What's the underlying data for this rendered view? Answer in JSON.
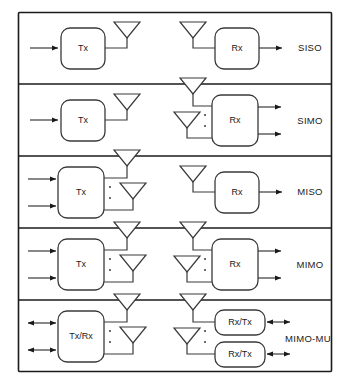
{
  "figure": {
    "title": "",
    "rows": [
      {
        "id": "siso",
        "mode_label": "SISO",
        "tx_label": "Tx",
        "rx_label": "Rx",
        "tx_inputs": 1,
        "rx_outputs": 1,
        "tx_antennas": 1,
        "rx_antennas": 1,
        "tx_ellipsis": false,
        "rx_ellipsis": false,
        "bidirectional": false
      },
      {
        "id": "simo",
        "mode_label": "SIMO",
        "tx_label": "Tx",
        "rx_label": "Rx",
        "tx_inputs": 1,
        "rx_outputs": 2,
        "tx_antennas": 1,
        "rx_antennas": 2,
        "tx_ellipsis": false,
        "rx_ellipsis": true,
        "bidirectional": false
      },
      {
        "id": "miso",
        "mode_label": "MISO",
        "tx_label": "Tx",
        "rx_label": "Rx",
        "tx_inputs": 2,
        "rx_outputs": 1,
        "tx_antennas": 2,
        "rx_antennas": 1,
        "tx_ellipsis": true,
        "rx_ellipsis": false,
        "bidirectional": false
      },
      {
        "id": "mimo",
        "mode_label": "MIMO",
        "tx_label": "Tx",
        "rx_label": "Rx",
        "tx_inputs": 2,
        "rx_outputs": 2,
        "tx_antennas": 2,
        "rx_antennas": 2,
        "tx_ellipsis": true,
        "rx_ellipsis": true,
        "bidirectional": false
      },
      {
        "id": "mimo-mu",
        "mode_label": "MIMO-MU",
        "tx_label": "Tx/Rx",
        "rx_label": "Rx/Tx",
        "rx_label_2": "Rx/Tx",
        "tx_inputs": 2,
        "rx_outputs": 2,
        "tx_antennas": 2,
        "rx_antennas": 2,
        "tx_ellipsis": true,
        "rx_ellipsis": true,
        "bidirectional": true
      }
    ],
    "colors": {
      "frame": "#1a1a1a",
      "line": "#3a3a3a",
      "text": "#1a1a1a",
      "background": "#ffffff"
    },
    "icons": {
      "antenna": "antenna-icon",
      "arrow": "arrow-icon",
      "ellipsis": "vertical-ellipsis-icon"
    }
  }
}
